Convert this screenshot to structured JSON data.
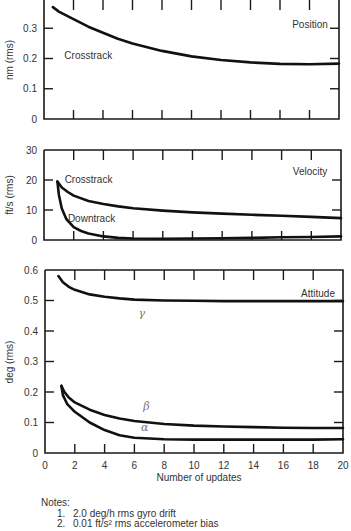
{
  "chart_data": [
    {
      "type": "line",
      "title": "Position",
      "ylabel": "nm (rms)",
      "xlabel": "",
      "xlim": [
        0,
        20
      ],
      "ylim": [
        0,
        0.4
      ],
      "yticks": [
        0,
        0.1,
        0.2,
        0.3
      ],
      "ytick_labels": [
        "0",
        "0.1",
        "0.2",
        "0.3"
      ],
      "grid": false,
      "series": [
        {
          "name": "Crosstrack",
          "x": [
            0.6,
            1,
            2,
            3,
            4,
            5,
            6,
            8,
            10,
            12,
            14,
            16,
            18,
            20
          ],
          "y": [
            0.37,
            0.355,
            0.33,
            0.305,
            0.285,
            0.265,
            0.25,
            0.225,
            0.207,
            0.195,
            0.187,
            0.182,
            0.181,
            0.183
          ]
        }
      ],
      "annotations": [
        {
          "text": "Crosstrack",
          "x": 3.0,
          "y": 0.2
        }
      ]
    },
    {
      "type": "line",
      "title": "Velocity",
      "ylabel": "ft/s (rms)",
      "xlabel": "",
      "xlim": [
        0,
        20
      ],
      "ylim": [
        0,
        30
      ],
      "yticks": [
        0,
        10,
        20,
        30
      ],
      "ytick_labels": [
        "0",
        "10",
        "20",
        "30"
      ],
      "grid": false,
      "series": [
        {
          "name": "Crosstrack",
          "x": [
            0.9,
            1.2,
            1.6,
            2,
            3,
            4,
            5,
            6,
            8,
            10,
            12,
            14,
            16,
            18,
            20
          ],
          "y": [
            19.5,
            17.5,
            16,
            14.8,
            13,
            12,
            11.2,
            10.6,
            9.8,
            9.2,
            8.8,
            8.4,
            8.1,
            7.7,
            7.3
          ]
        },
        {
          "name": "Downtrack",
          "x": [
            0.9,
            1.0,
            1.2,
            1.5,
            2,
            2.5,
            3,
            4,
            5,
            6,
            8,
            10,
            12,
            14,
            16,
            18,
            20
          ],
          "y": [
            19.5,
            15,
            10.5,
            7,
            4.3,
            3,
            2.2,
            1.2,
            0.7,
            0.5,
            0.4,
            0.5,
            0.6,
            0.7,
            0.9,
            1.0,
            1.2
          ]
        }
      ],
      "annotations": [
        {
          "text": "Crosstrack",
          "x": 3.0,
          "y": 19
        },
        {
          "text": "Downtrack",
          "x": 3.2,
          "y": 6
        }
      ]
    },
    {
      "type": "line",
      "title": "Attitude",
      "ylabel": "deg (rms)",
      "xlabel": "Number of updates",
      "xlim": [
        0,
        20
      ],
      "ylim": [
        0,
        0.6
      ],
      "xticks": [
        0,
        2,
        4,
        6,
        8,
        10,
        12,
        14,
        16,
        18,
        20
      ],
      "xtick_labels": [
        "0",
        "2",
        "4",
        "6",
        "8",
        "10",
        "12",
        "14",
        "16",
        "18",
        "20"
      ],
      "yticks": [
        0,
        0.1,
        0.2,
        0.3,
        0.4,
        0.5,
        0.6
      ],
      "ytick_labels": [
        "0",
        "0.1",
        "0.2",
        "0.3",
        "0.4",
        "0.5",
        "0.6"
      ],
      "grid": false,
      "series": [
        {
          "name": "γ",
          "x": [
            0.9,
            1.2,
            1.6,
            2,
            3,
            4,
            5,
            6,
            8,
            10,
            12,
            14,
            16,
            18,
            20
          ],
          "y": [
            0.58,
            0.56,
            0.545,
            0.535,
            0.52,
            0.512,
            0.507,
            0.503,
            0.5,
            0.499,
            0.498,
            0.498,
            0.498,
            0.498,
            0.498
          ]
        },
        {
          "name": "β",
          "x": [
            1.1,
            1.3,
            1.6,
            2,
            3,
            4,
            5,
            6,
            8,
            10,
            12,
            14,
            16,
            18,
            20
          ],
          "y": [
            0.22,
            0.2,
            0.182,
            0.166,
            0.142,
            0.125,
            0.113,
            0.105,
            0.095,
            0.09,
            0.087,
            0.085,
            0.083,
            0.082,
            0.082
          ]
        },
        {
          "name": "α",
          "x": [
            1.1,
            1.2,
            1.5,
            2,
            3,
            4,
            5,
            6,
            8,
            10,
            12,
            14,
            16,
            18,
            20
          ],
          "y": [
            0.22,
            0.19,
            0.16,
            0.135,
            0.1,
            0.075,
            0.058,
            0.05,
            0.045,
            0.044,
            0.044,
            0.044,
            0.044,
            0.044,
            0.045
          ]
        }
      ],
      "annotations": [
        {
          "text": "γ",
          "x": 6.5,
          "y": 0.445
        },
        {
          "text": "β",
          "x": 6.8,
          "y": 0.14
        },
        {
          "text": "α",
          "x": 6.7,
          "y": 0.072
        }
      ]
    }
  ],
  "notes": {
    "heading": "Notes:",
    "items": [
      {
        "num": "1.",
        "text": "2.0 deg/h rms gyro drift"
      },
      {
        "num": "2.",
        "text": "0.01 ft/s² rms accelerometer bias"
      }
    ]
  }
}
